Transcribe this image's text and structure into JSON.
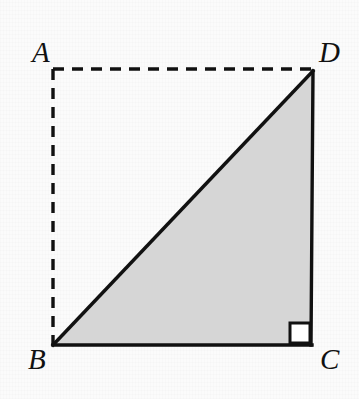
{
  "figure": {
    "name": "right-triangle-in-rectangle",
    "width": 359,
    "height": 399,
    "background_color": "#fbfbfb",
    "triangle_fill_color": "#d6d6d6",
    "stroke_color": "#111111",
    "vertices": [
      {
        "label": "A",
        "x": 53,
        "y": 69,
        "style": "implied"
      },
      {
        "label": "D",
        "x": 313,
        "y": 71,
        "style": "drawn"
      },
      {
        "label": "B",
        "x": 53,
        "y": 345,
        "style": "drawn"
      },
      {
        "label": "C",
        "x": 311,
        "y": 345,
        "style": "drawn"
      }
    ],
    "segments": [
      {
        "name": "AD",
        "from": "A",
        "to": "D",
        "style": "dashed"
      },
      {
        "name": "AB",
        "from": "A",
        "to": "B",
        "style": "dashed"
      },
      {
        "name": "BD",
        "from": "B",
        "to": "D",
        "style": "solid"
      },
      {
        "name": "BC",
        "from": "B",
        "to": "C",
        "style": "solid"
      },
      {
        "name": "CD",
        "from": "C",
        "to": "D",
        "style": "solid"
      }
    ],
    "shaded_region": {
      "name": "triangle-BCD",
      "vertices": [
        "B",
        "C",
        "D"
      ],
      "fill": "#d6d6d6"
    },
    "right_angle_marker": {
      "at_vertex": "C",
      "size": 20,
      "fill": "#ffffff",
      "stroke": "#111111"
    }
  },
  "labels": {
    "A": "A",
    "B": "B",
    "C": "C",
    "D": "D"
  },
  "ghost_text": {
    "line1": "",
    "line2": "",
    "line3": ""
  }
}
